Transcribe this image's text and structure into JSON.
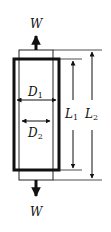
{
  "diagram": {
    "type": "specimen-tension-schematic",
    "load_top": {
      "label": "W",
      "direction": "up"
    },
    "load_bottom": {
      "label": "W",
      "direction": "down"
    },
    "dimensions": {
      "D1": {
        "symbol": "D",
        "subscript": "1",
        "orientation": "horizontal"
      },
      "D2": {
        "symbol": "D",
        "subscript": "2",
        "orientation": "horizontal"
      },
      "L1": {
        "symbol": "L",
        "subscript": "1",
        "orientation": "vertical"
      },
      "L2": {
        "symbol": "L",
        "subscript": "2",
        "orientation": "vertical"
      }
    },
    "colors": {
      "stroke": "#111111",
      "background": "#ffffff"
    }
  }
}
